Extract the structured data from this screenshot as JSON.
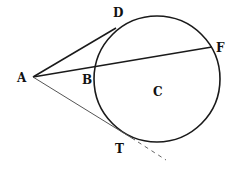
{
  "diagram": {
    "type": "geometry-circle-tangent-secant",
    "colors": {
      "stroke": "#1a1a1a",
      "background": "#ffffff",
      "tangent_lower": "#555555"
    },
    "circle": {
      "center_label": "C",
      "cx": 157,
      "cy": 79,
      "r": 63
    },
    "points": {
      "A": {
        "label": "A",
        "x": 33,
        "y": 77,
        "label_x": 17,
        "label_y": 82
      },
      "D": {
        "label": "D",
        "x": 116,
        "y": 28,
        "label_x": 113,
        "label_y": 17
      },
      "B": {
        "label": "B",
        "x": 96,
        "y": 67,
        "label_x": 82,
        "label_y": 84
      },
      "F": {
        "label": "F",
        "x": 212,
        "y": 47,
        "label_x": 216,
        "label_y": 52
      },
      "T": {
        "label": "T",
        "x": 135,
        "y": 140,
        "label_x": 115,
        "label_y": 153
      },
      "C": {
        "label": "C",
        "x": 157,
        "y": 92,
        "label_x": 153,
        "label_y": 96
      }
    },
    "segments": [
      {
        "name": "tangent-AD",
        "from": "A",
        "to": "D",
        "style": "solid"
      },
      {
        "name": "secant-AF",
        "from": "A",
        "to": "F",
        "style": "solid"
      },
      {
        "name": "tangent-AT",
        "from": "A",
        "to": "T",
        "style": "solid-thin"
      },
      {
        "name": "tangent-extension",
        "from": "T",
        "x2": 166,
        "y2": 160,
        "style": "dashed"
      }
    ]
  }
}
